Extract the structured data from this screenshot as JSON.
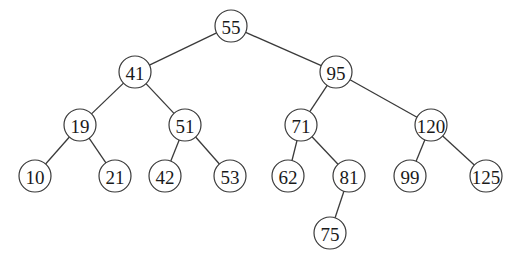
{
  "diagram": {
    "type": "binary-search-tree",
    "node_radius": 16,
    "nodes": [
      {
        "id": "n55",
        "label": "55",
        "x": 231,
        "y": 26
      },
      {
        "id": "n41",
        "label": "41",
        "x": 135,
        "y": 72
      },
      {
        "id": "n95",
        "label": "95",
        "x": 336,
        "y": 72
      },
      {
        "id": "n19",
        "label": "19",
        "x": 80,
        "y": 125
      },
      {
        "id": "n51",
        "label": "51",
        "x": 185,
        "y": 125
      },
      {
        "id": "n71",
        "label": "71",
        "x": 301,
        "y": 125
      },
      {
        "id": "n120",
        "label": "120",
        "x": 431,
        "y": 125
      },
      {
        "id": "n10",
        "label": "10",
        "x": 35,
        "y": 176
      },
      {
        "id": "n21",
        "label": "21",
        "x": 115,
        "y": 176
      },
      {
        "id": "n42",
        "label": "42",
        "x": 165,
        "y": 176
      },
      {
        "id": "n53",
        "label": "53",
        "x": 230,
        "y": 176
      },
      {
        "id": "n62",
        "label": "62",
        "x": 288,
        "y": 176
      },
      {
        "id": "n81",
        "label": "81",
        "x": 349,
        "y": 176
      },
      {
        "id": "n99",
        "label": "99",
        "x": 410,
        "y": 176
      },
      {
        "id": "n125",
        "label": "125",
        "x": 486,
        "y": 176
      },
      {
        "id": "n75",
        "label": "75",
        "x": 330,
        "y": 233
      }
    ],
    "edges": [
      [
        "n55",
        "n41"
      ],
      [
        "n55",
        "n95"
      ],
      [
        "n41",
        "n19"
      ],
      [
        "n41",
        "n51"
      ],
      [
        "n95",
        "n71"
      ],
      [
        "n95",
        "n120"
      ],
      [
        "n19",
        "n10"
      ],
      [
        "n19",
        "n21"
      ],
      [
        "n51",
        "n42"
      ],
      [
        "n51",
        "n53"
      ],
      [
        "n71",
        "n62"
      ],
      [
        "n71",
        "n81"
      ],
      [
        "n120",
        "n99"
      ],
      [
        "n120",
        "n125"
      ],
      [
        "n81",
        "n75"
      ]
    ]
  }
}
